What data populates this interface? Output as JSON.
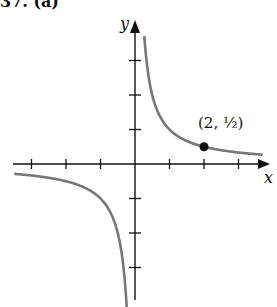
{
  "title": "37. (a)",
  "chart_data": {
    "type": "line",
    "xlabel": "x",
    "ylabel": "y",
    "xlim": [
      -3.5,
      3.8
    ],
    "ylim": [
      -3.7,
      4.0
    ],
    "grid": false,
    "x_ticks": [
      -3,
      -2,
      -1,
      1,
      2,
      3
    ],
    "y_ticks": [
      -3,
      -2,
      -1,
      1,
      2,
      3
    ],
    "series": [
      {
        "name": "branch-positive",
        "x_range": [
          0.27,
          3.7
        ],
        "function": "1/x"
      },
      {
        "name": "branch-negative",
        "x_range": [
          -3.5,
          -0.24
        ],
        "function": "1/x"
      }
    ],
    "annotations": [
      {
        "x": 2,
        "y": 0.5,
        "text": "(2, 1/2)",
        "marker": "dot"
      }
    ]
  },
  "labels": {
    "x": "x",
    "y": "y",
    "point": "(2, ½)"
  }
}
